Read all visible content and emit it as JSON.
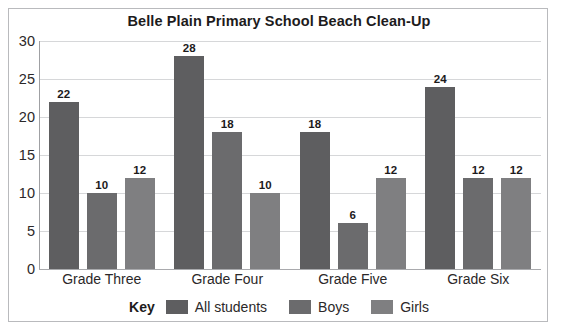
{
  "chart_data": {
    "type": "bar",
    "title": "Belle Plain Primary School Beach Clean-Up",
    "xlabel": "",
    "ylabel": "",
    "ylim": [
      0,
      30
    ],
    "yticks": [
      0,
      5,
      10,
      15,
      20,
      25,
      30
    ],
    "grid": true,
    "legend_position": "bottom",
    "legend_title": "Key",
    "categories": [
      "Grade Three",
      "Grade Four",
      "Grade Five",
      "Grade Six"
    ],
    "series": [
      {
        "name": "All students",
        "color": "#5e5e60",
        "values": [
          22,
          28,
          18,
          24
        ]
      },
      {
        "name": "Boys",
        "color": "#6b6b6d",
        "values": [
          10,
          18,
          6,
          12
        ]
      },
      {
        "name": "Girls",
        "color": "#7f7f81",
        "values": [
          12,
          10,
          12,
          12
        ]
      }
    ]
  }
}
